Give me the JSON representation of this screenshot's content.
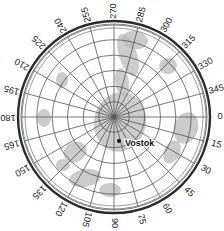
{
  "figure": {
    "name": "antarctic-polar-stereographic-map",
    "background_color": "#ffffff",
    "projection": "polar-stereographic",
    "center_x": 114,
    "center_y": 117,
    "outer_radius": 96
  },
  "graticule": {
    "ring_color": "#555555",
    "ring_count": 6,
    "meridian_color": "#555555",
    "meridian_count": 24,
    "border_color": "#2b2b2b",
    "inner_ring_color": "#6e6e6e",
    "ring_radii_fraction": [
      0.165,
      0.33,
      0.5,
      0.665,
      0.83,
      1.0
    ]
  },
  "longitude_labels": [
    {
      "text": "0",
      "angle_deg": 0
    },
    {
      "text": "15",
      "angle_deg": 15
    },
    {
      "text": "30",
      "angle_deg": 30
    },
    {
      "text": "45",
      "angle_deg": 45
    },
    {
      "text": "60",
      "angle_deg": 60
    },
    {
      "text": "75",
      "angle_deg": 75
    },
    {
      "text": "90",
      "angle_deg": 90
    },
    {
      "text": "105",
      "angle_deg": 105
    },
    {
      "text": "120",
      "angle_deg": 120
    },
    {
      "text": "135",
      "angle_deg": 135
    },
    {
      "text": "150",
      "angle_deg": 150
    },
    {
      "text": "165",
      "angle_deg": 165
    },
    {
      "text": "180",
      "angle_deg": 180
    },
    {
      "text": "195",
      "angle_deg": 195
    },
    {
      "text": "210",
      "angle_deg": 210
    },
    {
      "text": "225",
      "angle_deg": 225
    },
    {
      "text": "240",
      "angle_deg": 240
    },
    {
      "text": "255",
      "angle_deg": 255
    },
    {
      "text": "270",
      "angle_deg": 270
    },
    {
      "text": "285",
      "angle_deg": 285
    },
    {
      "text": "300",
      "angle_deg": 300
    },
    {
      "text": "315",
      "angle_deg": 315
    },
    {
      "text": "330",
      "angle_deg": 330
    },
    {
      "text": "345",
      "angle_deg": 345
    }
  ],
  "stations": [
    {
      "name": "Vostok",
      "label": "Vostok",
      "marker_x": 119,
      "marker_y": 141,
      "label_x": 125,
      "label_y": 144,
      "marker_color": "#111111"
    }
  ],
  "shading": {
    "fill_color": "#b9b9b9",
    "fill_opacity": 0.75,
    "patches": [
      {
        "id": "patch-upper-center",
        "cx": 128,
        "cy": 55,
        "rx": 9,
        "ry": 22,
        "rot": -18
      },
      {
        "id": "patch-upper-wide",
        "cx": 135,
        "cy": 40,
        "rx": 13,
        "ry": 9,
        "rot": 10
      },
      {
        "id": "patch-upper-tail",
        "cx": 122,
        "cy": 82,
        "rx": 7,
        "ry": 14,
        "rot": -8
      },
      {
        "id": "patch-core",
        "cx": 120,
        "cy": 122,
        "rx": 26,
        "ry": 30,
        "rot": 12
      },
      {
        "id": "patch-left-mid",
        "cx": 75,
        "cy": 152,
        "rx": 12,
        "ry": 10,
        "rot": -30
      },
      {
        "id": "patch-left-low",
        "cx": 85,
        "cy": 178,
        "rx": 16,
        "ry": 9,
        "rot": -10
      },
      {
        "id": "patch-lower-left",
        "cx": 63,
        "cy": 165,
        "rx": 7,
        "ry": 6,
        "rot": 0
      },
      {
        "id": "patch-lower-center",
        "cx": 110,
        "cy": 190,
        "rx": 11,
        "ry": 7,
        "rot": 0
      },
      {
        "id": "patch-right-edge",
        "cx": 186,
        "cy": 128,
        "rx": 12,
        "ry": 16,
        "rot": 18
      },
      {
        "id": "patch-right-mid",
        "cx": 172,
        "cy": 152,
        "rx": 8,
        "ry": 12,
        "rot": 25
      },
      {
        "id": "patch-right-up",
        "cx": 168,
        "cy": 66,
        "rx": 9,
        "ry": 8,
        "rot": -20
      },
      {
        "id": "patch-left-up",
        "cx": 62,
        "cy": 80,
        "rx": 6,
        "ry": 8,
        "rot": 0
      },
      {
        "id": "patch-far-left",
        "cx": 44,
        "cy": 118,
        "rx": 7,
        "ry": 9,
        "rot": 0
      }
    ]
  }
}
